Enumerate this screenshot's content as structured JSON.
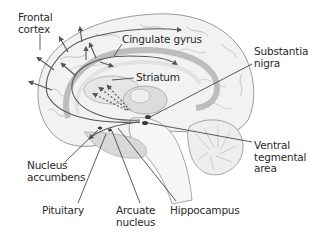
{
  "diagram": {
    "colors": {
      "background": "#ffffff",
      "brain_fill": "#f2f2f2",
      "brain_line": "#9a9a9a",
      "pathway": "#555555",
      "leader": "#333333",
      "label_text": "#2a2a2a",
      "nucleus_dark": "#3a3a3a"
    },
    "labels": {
      "frontal_cortex": {
        "line1": "Frontal",
        "line2": "cortex"
      },
      "cingulate_gyrus": {
        "line1": "Cingulate gyrus"
      },
      "striatum": {
        "line1": "Striatum"
      },
      "substantia_nigra": {
        "line1": "Substantia",
        "line2": "nigra"
      },
      "ventral_tegmental_area": {
        "line1": "Ventral",
        "line2": "tegmental",
        "line3": "area"
      },
      "nucleus_accumbens": {
        "line1": "Nucleus",
        "line2": "accumbens"
      },
      "pituitary": {
        "line1": "Pituitary"
      },
      "arcuate_nucleus": {
        "line1": "Arcuate",
        "line2": "nucleus"
      },
      "hippocampus": {
        "line1": "Hippocampus"
      }
    }
  }
}
